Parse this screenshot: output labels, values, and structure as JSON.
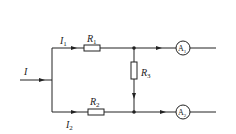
{
  "diagram": {
    "type": "circuit",
    "labels": {
      "I": "I",
      "I1": {
        "main": "I",
        "sub": "1"
      },
      "I2": {
        "main": "I",
        "sub": "2"
      },
      "R1": {
        "main": "R",
        "sub": "1"
      },
      "R2": {
        "main": "R",
        "sub": "2"
      },
      "R3": {
        "main": "R",
        "sub": "3"
      },
      "A1": {
        "main": "A",
        "sub": "1"
      },
      "A2": {
        "main": "A",
        "sub": "2"
      }
    },
    "colors": {
      "line": "#222222",
      "background": "#ffffff"
    }
  }
}
